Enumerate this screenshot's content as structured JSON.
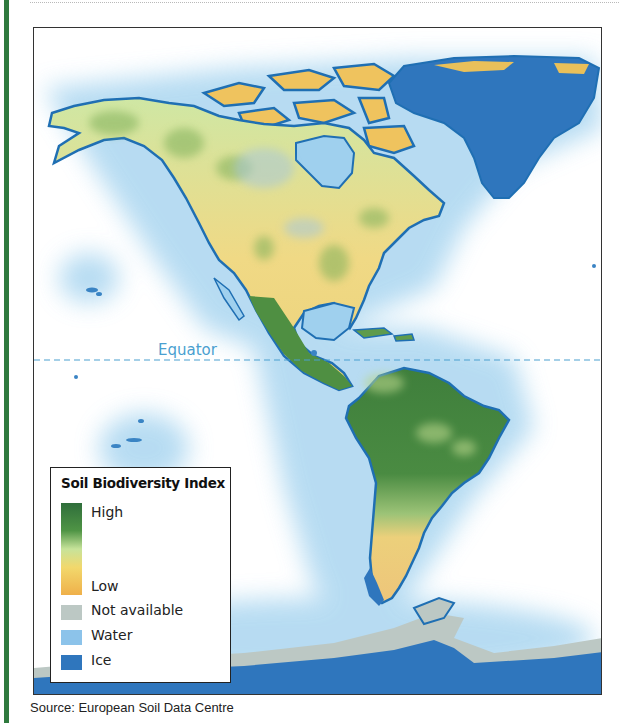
{
  "map": {
    "title": "Soil Biodiversity Index",
    "region": "Americas",
    "equator_label": "Equator",
    "legend": {
      "title": "Soil Biodiversity Index",
      "gradient": {
        "high_label": "High",
        "low_label": "Low",
        "colors": [
          "#2f6e3b",
          "#4f9445",
          "#c7e39a",
          "#f2d86c",
          "#efb04a"
        ]
      },
      "categories": [
        {
          "label": "Not available",
          "color": "#bcc8c4"
        },
        {
          "label": "Water",
          "color": "#8cc3ea"
        },
        {
          "label": "Ice",
          "color": "#2f76bd"
        }
      ]
    },
    "colors": {
      "ocean_glow": "#9fd0ee",
      "coastline": "#1f6fb3",
      "ice": "#2f76bd",
      "not_available": "#bcc8c4",
      "equator_line": "#4a9fd0",
      "side_bar": "#2f7a3e"
    }
  },
  "source": "Source: European Soil Data Centre"
}
